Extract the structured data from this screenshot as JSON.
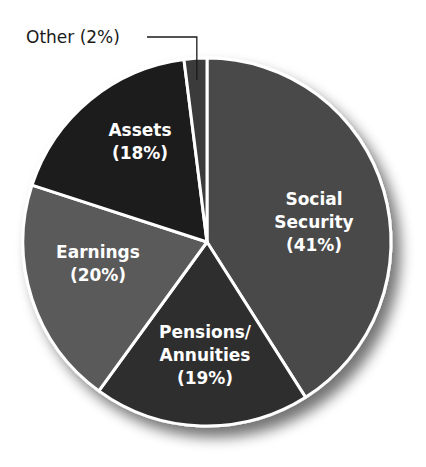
{
  "chart_data": {
    "type": "pie",
    "title": "",
    "start_angle_deg": 0,
    "direction": "clockwise",
    "slices": [
      {
        "label": "Social Security",
        "label_lines": [
          "Social",
          "Security",
          "(41%)"
        ],
        "value": 41,
        "color": "#4a4a4a"
      },
      {
        "label": "Pensions/Annuities",
        "label_lines": [
          "Pensions/",
          "Annuities",
          "(19%)"
        ],
        "value": 19,
        "color": "#2e2e2e"
      },
      {
        "label": "Earnings",
        "label_lines": [
          "Earnings",
          "(20%)"
        ],
        "value": 20,
        "color": "#5a5a5a"
      },
      {
        "label": "Assets",
        "label_lines": [
          "Assets",
          "(18%)"
        ],
        "value": 18,
        "color": "#1c1c1c"
      },
      {
        "label": "Other",
        "label_lines": [
          "Other (2%)"
        ],
        "value": 2,
        "color": "#3a3a3a",
        "callout": true
      }
    ],
    "legend": "none",
    "grid": false,
    "outline_color": "#ffffff"
  }
}
